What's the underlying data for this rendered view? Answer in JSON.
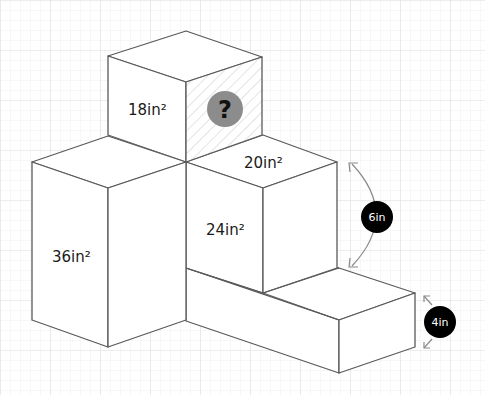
{
  "diagram": {
    "type": "isometric-box-stack",
    "faces": {
      "top_cube_left": "18in²",
      "top_cube_right": "?",
      "left_box_front": "36in²",
      "middle_box_top": "20in²",
      "middle_box_front": "24in²"
    },
    "dimensions": {
      "height_badge": "6in",
      "depth_badge": "4in"
    },
    "colors": {
      "background": "#ffffff",
      "grid_minor": "#f0f0f0",
      "grid_major": "#e2e2e2",
      "edges": "#5a5a5a",
      "unknown_circle": "#8c8c8c",
      "badge": "#000000",
      "hatch": "#d4d4d4",
      "arrows": "#8a8a8a"
    },
    "icons": {
      "unknown": "question-mark-icon"
    }
  }
}
